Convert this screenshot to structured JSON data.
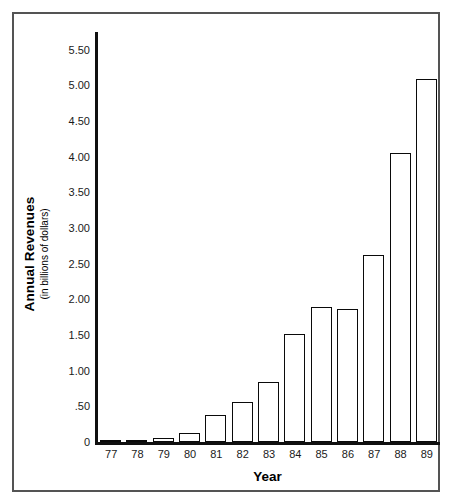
{
  "chart_data": {
    "type": "bar",
    "title": "",
    "xlabel": "Year",
    "ylabel": "Annual Revenues",
    "ylabel_sub": "(in billions of dollars)",
    "categories": [
      "77",
      "78",
      "79",
      "80",
      "81",
      "82",
      "83",
      "84",
      "85",
      "86",
      "87",
      "88",
      "89"
    ],
    "values": [
      0.01,
      0.02,
      0.05,
      0.13,
      0.38,
      0.56,
      0.84,
      1.51,
      1.89,
      1.86,
      2.62,
      4.05,
      5.09
    ],
    "ytick_labels": [
      "5.50",
      "5.00",
      "4.50",
      "4.00",
      "3.50",
      "3.00",
      "2.50",
      "2.00",
      "1.50",
      "1.00",
      ".50",
      "0"
    ],
    "ytick_values": [
      5.5,
      5.0,
      4.5,
      4.0,
      3.5,
      3.0,
      2.5,
      2.0,
      1.5,
      1.0,
      0.5,
      0
    ],
    "ylim": [
      0,
      5.75
    ],
    "grid": false,
    "legend": false,
    "bar_fill_color": "#ffffff",
    "bar_edge_color": "#0a0a0a",
    "axis_color": "#101010",
    "frame_color": "#545454",
    "background_color": "#ffffff"
  }
}
